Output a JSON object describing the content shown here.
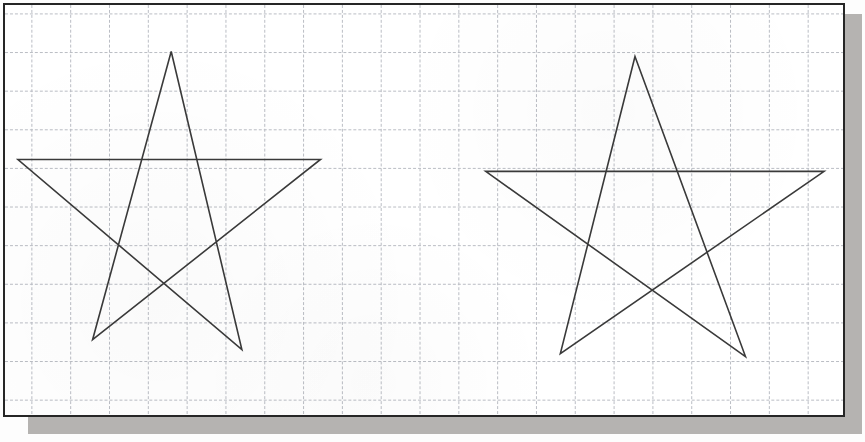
{
  "document": {
    "kind": "scanned-graph-paper-worksheet",
    "width": 865,
    "height": 442,
    "paper_color": "#ffffff",
    "frame_color": "#262626",
    "shadow_color": "#a8a6a3",
    "ink_color": "#3a3a3a"
  },
  "grid": {
    "style": "dashed",
    "color": "#b9bcc4",
    "line_width": 1,
    "dash": "3 2",
    "spacing_x": 39,
    "spacing_y": 39,
    "origin_x": 32,
    "origin_y": 14,
    "x_lines": [
      32,
      71,
      110,
      149,
      188,
      227,
      266,
      305,
      344,
      383,
      422,
      461,
      500,
      539,
      578,
      617,
      656,
      695,
      734,
      773,
      812
    ],
    "y_lines": [
      14,
      53,
      92,
      131,
      170,
      209,
      248,
      287,
      326,
      365,
      404
    ]
  },
  "figures": [
    {
      "name": "left-star",
      "label": "hand-drawn five-pointed star (left)",
      "stroke": "#3a3a3a",
      "stroke_width": 1.6,
      "points": [
        [
          172,
          52
        ],
        [
          243,
          353
        ],
        [
          18,
          161
        ],
        [
          322,
          161
        ],
        [
          93,
          343
        ]
      ]
    },
    {
      "name": "right-star",
      "label": "hand-drawn five-pointed star (right)",
      "stroke": "#3a3a3a",
      "stroke_width": 1.6,
      "points": [
        [
          638,
          57
        ],
        [
          749,
          360
        ],
        [
          488,
          173
        ],
        [
          828,
          173
        ],
        [
          563,
          357
        ]
      ]
    }
  ]
}
